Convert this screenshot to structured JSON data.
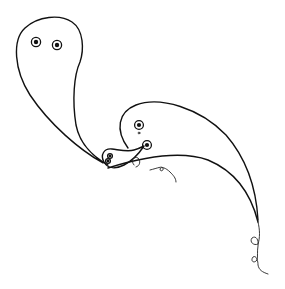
{
  "drawing": {
    "title": "",
    "description": "Line drawing of two ghost-like tadpole figures with curling tails",
    "colors": {
      "background": "#ffffff",
      "ink": "#111111"
    },
    "figures": [
      {
        "name": "large-ghost",
        "eyes": 2
      },
      {
        "name": "medium-ghost",
        "eyes": 2
      },
      {
        "name": "small-creature",
        "eyes": 2
      }
    ]
  }
}
